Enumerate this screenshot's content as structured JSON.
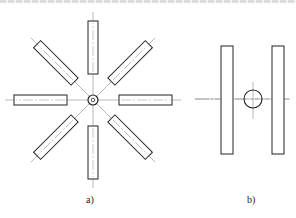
{
  "figure": {
    "colors": {
      "stroke": "#222222",
      "centerline": "#8a8a8a",
      "background": "#ffffff"
    },
    "panel_a": {
      "label": "a)",
      "center": [
        93,
        100
      ],
      "hub_radius": 5,
      "arm_count": 8,
      "arm_length": 53,
      "arm_width": 10,
      "arm_inner_offset": 26,
      "centerline_extent": 88
    },
    "panel_b": {
      "label": "b)",
      "circle_center": [
        253,
        99
      ],
      "circle_radius": 9,
      "bars": [
        {
          "x": 221,
          "y": 46,
          "w": 12,
          "h": 108
        },
        {
          "x": 272,
          "y": 46,
          "w": 12,
          "h": 108
        }
      ],
      "h_centerline": [
        195,
        290
      ],
      "v_centerline": [
        82,
        119
      ]
    }
  }
}
